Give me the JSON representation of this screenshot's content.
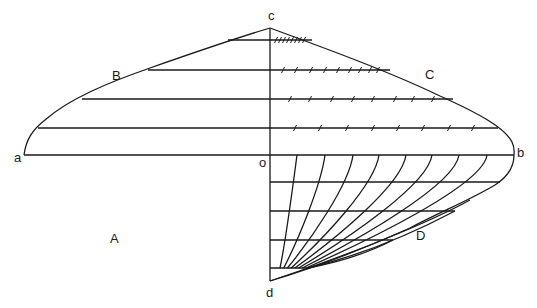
{
  "diagram": {
    "axis_x": 270,
    "labels": [
      {
        "id": "c",
        "text": "c",
        "x": 268,
        "y": 20
      },
      {
        "id": "B",
        "text": "B",
        "x": 112,
        "y": 80
      },
      {
        "id": "C",
        "text": "C",
        "x": 425,
        "y": 79
      },
      {
        "id": "a",
        "text": "a",
        "x": 14,
        "y": 162
      },
      {
        "id": "o",
        "text": "o",
        "x": 259,
        "y": 167
      },
      {
        "id": "b",
        "text": "b",
        "x": 517,
        "y": 157
      },
      {
        "id": "A",
        "text": "A",
        "x": 110,
        "y": 243
      },
      {
        "id": "D",
        "text": "D",
        "x": 416,
        "y": 240
      },
      {
        "id": "d",
        "text": "d",
        "x": 266,
        "y": 297
      }
    ],
    "upper_rows": [
      {
        "y": 40,
        "x_left": 228,
        "x_right": 312,
        "ticks": [
          276,
          280,
          284,
          288,
          292,
          296,
          300,
          304
        ]
      },
      {
        "y": 70,
        "x_left": 148,
        "x_right": 390,
        "ticks": [
          283,
          296,
          311,
          325,
          338,
          350,
          360,
          370,
          378
        ]
      },
      {
        "y": 99,
        "x_left": 82,
        "x_right": 453,
        "ticks": [
          290,
          310,
          332,
          353,
          373,
          395,
          413,
          433
        ]
      },
      {
        "y": 128,
        "x_left": 38,
        "x_right": 498,
        "ticks": [
          295,
          320,
          347,
          373,
          398,
          423,
          449,
          473
        ]
      }
    ],
    "baseline": {
      "y": 155,
      "x_left": 24,
      "x_right": 514
    },
    "lower_rows": [
      {
        "y": 182,
        "x_right": 500
      },
      {
        "y": 211,
        "x_right": 455
      },
      {
        "y": 240,
        "x_right": 393
      },
      {
        "y": 268,
        "x_right": 310
      }
    ],
    "fan_curves_start_x": [
      297,
      325,
      353,
      379,
      406,
      432,
      459,
      487
    ],
    "fan_focus": {
      "x": 308,
      "y": 268
    },
    "apex_c": {
      "x": 270,
      "y": 28
    },
    "vertex_d": {
      "x": 270,
      "y": 281
    }
  }
}
